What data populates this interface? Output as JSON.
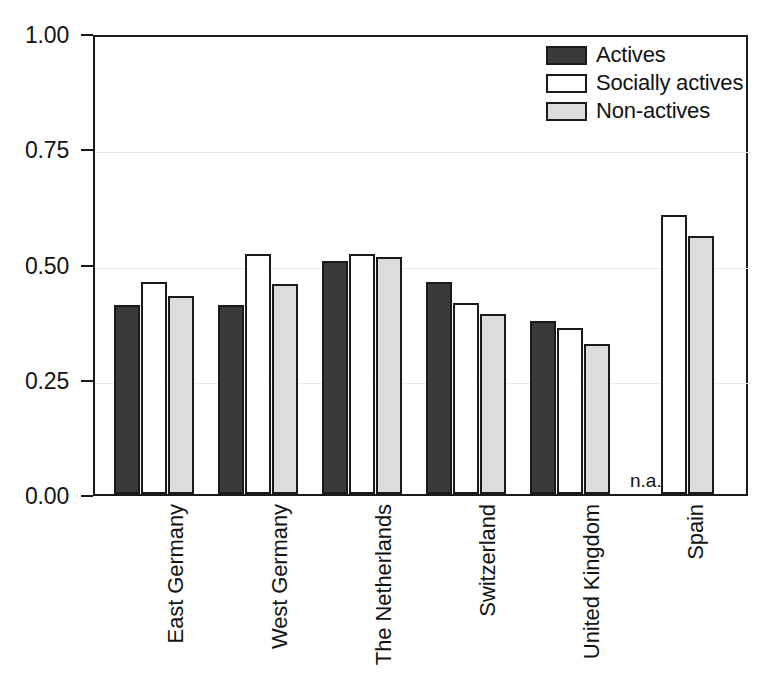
{
  "chart_data": {
    "type": "bar",
    "title": "",
    "subtitle": "",
    "xlabel": "",
    "ylabel": "",
    "ylim": [
      0.0,
      1.0
    ],
    "yticks": [
      "0.00",
      "0.25",
      "0.50",
      "0.75",
      "1.00"
    ],
    "ytick_values": [
      0.0,
      0.25,
      0.5,
      0.75,
      1.0
    ],
    "grid": true,
    "legend_position": "top-right",
    "categories": [
      "East Germany",
      "West Germany",
      "The Netherlands",
      "Switzerland",
      "United Kingdom",
      "Spain"
    ],
    "series": [
      {
        "name": "Actives",
        "color": "#3a3a3a",
        "values": [
          0.41,
          0.41,
          0.505,
          0.46,
          0.375,
          null
        ]
      },
      {
        "name": "Socially actives",
        "color": "#ffffff",
        "values": [
          0.46,
          0.52,
          0.52,
          0.415,
          0.36,
          0.605
        ]
      },
      {
        "name": "Non-actives",
        "color": "#dcdcdc",
        "values": [
          0.43,
          0.455,
          0.515,
          0.39,
          0.325,
          0.56
        ]
      }
    ],
    "annotations": [
      {
        "text": "n.a.",
        "category": "Spain",
        "series": "Actives",
        "note": "no data available for Actives in Spain"
      }
    ]
  },
  "legend": {
    "items": [
      {
        "label": "Actives",
        "swatch": "series-actives"
      },
      {
        "label": "Socially actives",
        "swatch": "series-socially"
      },
      {
        "label": "Non-actives",
        "swatch": "series-nonactives"
      }
    ]
  },
  "colors": {
    "actives": "#3a3a3a",
    "socially_actives": "#ffffff",
    "non_actives": "#dcdcdc",
    "axis": "#1a1a1a",
    "grid": "#e8e8e8",
    "background": "#ffffff"
  }
}
